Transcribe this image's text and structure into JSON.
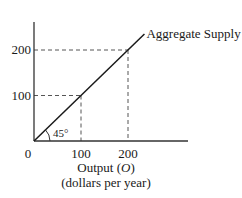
{
  "chart_data": {
    "type": "line",
    "title": "",
    "xlabel": "Output (O)",
    "xlabel_sub": "(dollars per year)",
    "ylabel": "",
    "xlim": [
      0,
      240
    ],
    "ylim": [
      0,
      250
    ],
    "x_ticks": [
      0,
      100,
      200
    ],
    "y_ticks": [
      100,
      200
    ],
    "x_tick_labels": [
      "0",
      "100",
      "200"
    ],
    "y_tick_labels": [
      "100",
      "200"
    ],
    "series": [
      {
        "name": "Aggregate Supply",
        "x": [
          0,
          100,
          200,
          235
        ],
        "y": [
          0,
          100,
          200,
          235
        ]
      }
    ],
    "reference_lines": [
      {
        "x": 100,
        "y": 100,
        "style": "dashed"
      },
      {
        "x": 200,
        "y": 200,
        "style": "dashed"
      }
    ],
    "annotations": [
      {
        "text": "45°",
        "meaning": "angle of the aggregate supply line from the origin"
      },
      {
        "text": "Aggregate Supply",
        "target": "series-end"
      }
    ],
    "grid": false
  },
  "labels": {
    "series_label": "Aggregate Supply",
    "angle": "45°",
    "x_main": "Output (",
    "x_var": "O",
    "x_close": ")",
    "x_sub": "(dollars per year)"
  }
}
